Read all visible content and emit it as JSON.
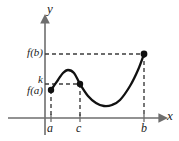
{
  "figure": {
    "background_color": "#ffffff",
    "curve_color": "#1a1a1a",
    "axis_color": "#6e6e6e",
    "dash_color": "#4d4d4d",
    "point_color": "#111111"
  },
  "axes": {
    "y_label": "y",
    "x_label": "x",
    "x_axis_y_px": 118,
    "y_axis_x_px": 45,
    "x_axis_start_px": 8,
    "x_axis_end_px": 164,
    "y_axis_top_px": 17
  },
  "x_ticks": [
    {
      "name": "a",
      "label": "a",
      "x_px": 51
    },
    {
      "name": "c",
      "label": "c",
      "x_px": 80
    },
    {
      "name": "b",
      "label": "b",
      "x_px": 144
    }
  ],
  "y_values": [
    {
      "name": "f(b)",
      "label": "f(b)",
      "y_px": 54
    },
    {
      "name": "k",
      "label": "k",
      "y_px": 84
    },
    {
      "name": "f(a)",
      "label": "f(a)",
      "y_px": 90
    }
  ],
  "points": [
    {
      "name": "point-a",
      "x_px": 51,
      "y_px": 90,
      "label": "(a, f(a))"
    },
    {
      "name": "point-c",
      "x_px": 80,
      "y_px": 84,
      "label": "(c, k)"
    },
    {
      "name": "point-b",
      "x_px": 144,
      "y_px": 54,
      "label": "(b, f(b))"
    }
  ],
  "chart_data": {
    "type": "line",
    "xlabel": "x",
    "ylabel": "y",
    "grid": false,
    "legend": null,
    "categories": [
      "a",
      "c",
      "b"
    ],
    "annotations": [
      "f(b)",
      "k",
      "f(a)",
      "a",
      "c",
      "b",
      "x",
      "y"
    ],
    "series": [
      {
        "name": "f",
        "points_px": [
          [
            51,
            90
          ],
          [
            58,
            80
          ],
          [
            63,
            73
          ],
          [
            68,
            70
          ],
          [
            74,
            73
          ],
          [
            80,
            84
          ],
          [
            88,
            96
          ],
          [
            96,
            103
          ],
          [
            104,
            106
          ],
          [
            112,
            105
          ],
          [
            120,
            100
          ],
          [
            130,
            86
          ],
          [
            138,
            70
          ],
          [
            144,
            54
          ]
        ]
      }
    ],
    "marked_points": [
      {
        "label": "(a, f(a))",
        "x": "a",
        "y": "f(a)"
      },
      {
        "label": "(c, k)",
        "x": "c",
        "y": "k"
      },
      {
        "label": "(b, f(b))",
        "x": "b",
        "y": "f(b)"
      }
    ],
    "dashed_guides": [
      {
        "name": "fb-horizontal",
        "from_px": [
          45,
          54
        ],
        "to_px": [
          144,
          54
        ]
      },
      {
        "name": "k-horizontal",
        "from_px": [
          45,
          84
        ],
        "to_px": [
          80,
          84
        ]
      },
      {
        "name": "a-vertical",
        "from_px": [
          51,
          90
        ],
        "to_px": [
          51,
          118
        ]
      },
      {
        "name": "c-vertical",
        "from_px": [
          80,
          84
        ],
        "to_px": [
          80,
          118
        ]
      },
      {
        "name": "b-vertical",
        "from_px": [
          144,
          54
        ],
        "to_px": [
          144,
          118
        ]
      }
    ]
  }
}
